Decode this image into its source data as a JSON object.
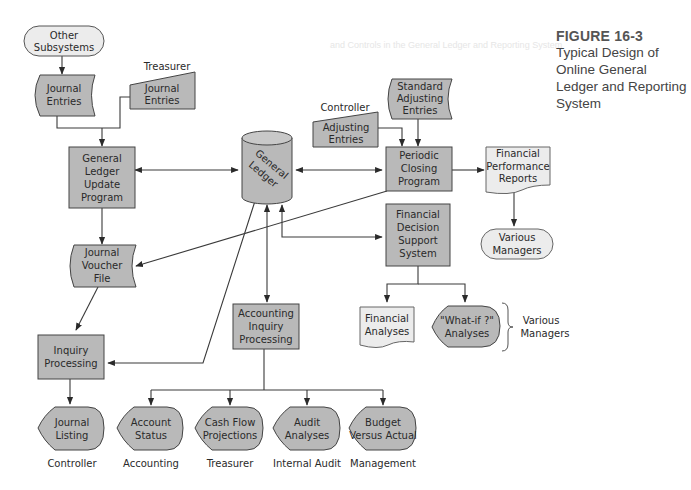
{
  "figure": {
    "number": "FIGURE 16-3",
    "title": "Typical Design of Online General Ledger and Reporting System"
  },
  "background_text": "and Controls in the General Ledger and Reporting System",
  "colors": {
    "process_fill": "#b9b9b9",
    "terminal_fill": "#ececec",
    "document_fill": "#ececec",
    "stroke": "#3a3a3a",
    "background": "#ffffff"
  },
  "nodes": {
    "other_subsystems": {
      "line1": "Other",
      "line2": "Subsystems"
    },
    "journal_entries_1": {
      "line1": "Journal",
      "line2": "Entries"
    },
    "treasurer_label": "Treasurer",
    "journal_entries_2": {
      "line1": "Journal",
      "line2": "Entries"
    },
    "gl_update": {
      "line1": "General",
      "line2": "Ledger",
      "line3": "Update",
      "line4": "Program"
    },
    "general_ledger": {
      "line1": "General",
      "line2": "Ledger"
    },
    "controller_label": "Controller",
    "adjusting_entries": {
      "line1": "Adjusting",
      "line2": "Entries"
    },
    "standard_adjusting": {
      "line1": "Standard",
      "line2": "Adjusting",
      "line3": "Entries"
    },
    "periodic_closing": {
      "line1": "Periodic",
      "line2": "Closing",
      "line3": "Program"
    },
    "financial_performance": {
      "line1": "Financial",
      "line2": "Performance",
      "line3": "Reports"
    },
    "various_managers_1": {
      "line1": "Various",
      "line2": "Managers"
    },
    "financial_dss": {
      "line1": "Financial",
      "line2": "Decision",
      "line3": "Support",
      "line4": "System"
    },
    "journal_voucher": {
      "line1": "Journal",
      "line2": "Voucher",
      "line3": "File"
    },
    "financial_analyses": {
      "line1": "Financial",
      "line2": "Analyses"
    },
    "whatif_analyses": {
      "line1": "\"What-if ?\"",
      "line2": "Analyses"
    },
    "various_managers_2": {
      "line1": "Various",
      "line2": "Managers"
    },
    "accounting_inquiry": {
      "line1": "Accounting",
      "line2": "Inquiry",
      "line3": "Processing"
    },
    "inquiry_processing": {
      "line1": "Inquiry",
      "line2": "Processing"
    }
  },
  "outputs": [
    {
      "line1": "Journal",
      "line2": "Listing",
      "caption": "Controller"
    },
    {
      "line1": "Account",
      "line2": "Status",
      "caption": "Accounting"
    },
    {
      "line1": "Cash Flow",
      "line2": "Projections",
      "caption": "Treasurer"
    },
    {
      "line1": "Audit",
      "line2": "Analyses",
      "caption": "Internal Audit"
    },
    {
      "line1": "Budget",
      "line2": "Versus Actual",
      "caption": "Management"
    }
  ]
}
